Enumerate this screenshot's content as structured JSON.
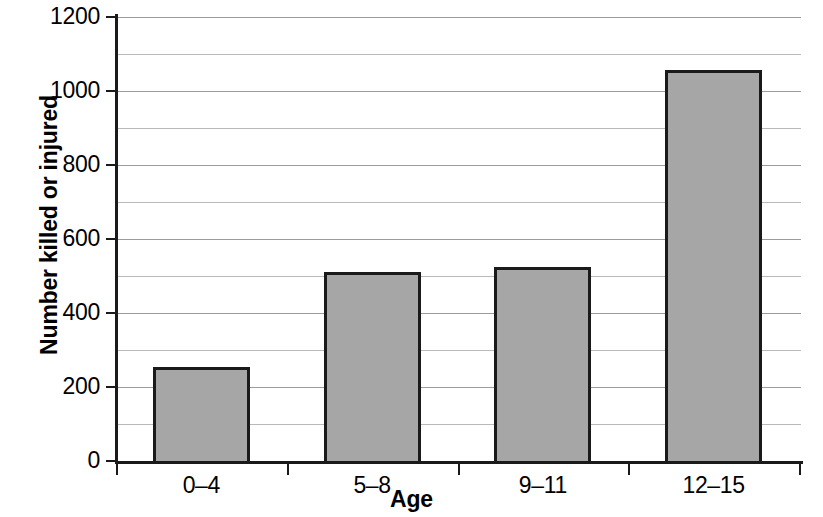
{
  "chart_data": {
    "type": "bar",
    "title": "",
    "subtitle": "",
    "xlabel": "Age",
    "ylabel": "Number killed or injured",
    "categories": [
      "0–4",
      "5–8",
      "9–11",
      "12–15"
    ],
    "values": [
      255,
      512,
      525,
      1058
    ],
    "ylim": [
      0,
      1200
    ],
    "ytick_labels": [
      "0",
      "200",
      "400",
      "600",
      "800",
      "1000",
      "1200"
    ],
    "ytick_values": [
      0,
      200,
      400,
      600,
      800,
      1000,
      1200
    ],
    "minor_gridline_values": [
      100,
      300,
      500,
      700,
      900,
      1100
    ],
    "grid": true,
    "legend": "none",
    "bar_fill_color": "#a6a6a6",
    "bar_edge_color": "#1a1a1a",
    "axis_color": "#1a1a1a",
    "gridline_color": "#b9b9bd",
    "background_color": "#ffffff"
  }
}
